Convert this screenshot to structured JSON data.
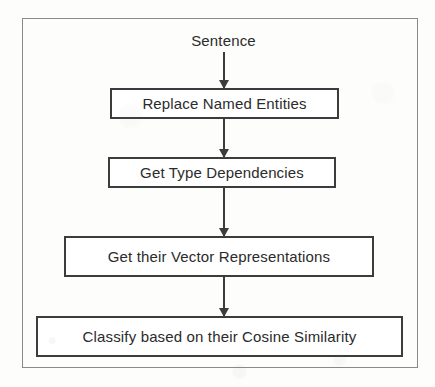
{
  "diagram": {
    "type": "flowchart",
    "orientation": "vertical",
    "title_label": "Sentence",
    "frame": {
      "border_color": "#8a8a8a"
    },
    "colors": {
      "background": "#fdfdfc",
      "box_border": "#3c3c3c",
      "box_fill": "#ffffff",
      "text": "#2b2b2b",
      "arrow": "#3c3c3c"
    },
    "nodes": [
      {
        "id": "sentence",
        "label": "Sentence",
        "shape": "text"
      },
      {
        "id": "replace-entities",
        "label": "Replace Named Entities",
        "shape": "rect"
      },
      {
        "id": "type-deps",
        "label": "Get Type Dependencies",
        "shape": "rect"
      },
      {
        "id": "vector-reps",
        "label": "Get their Vector Representations",
        "shape": "rect"
      },
      {
        "id": "classify",
        "label": "Classify based on their Cosine Similarity",
        "shape": "rect"
      }
    ],
    "edges": [
      {
        "from": "sentence",
        "to": "replace-entities",
        "style": "arrow-down"
      },
      {
        "from": "replace-entities",
        "to": "type-deps",
        "style": "arrow-down"
      },
      {
        "from": "type-deps",
        "to": "vector-reps",
        "style": "arrow-down"
      },
      {
        "from": "vector-reps",
        "to": "classify",
        "style": "arrow-down"
      }
    ]
  }
}
